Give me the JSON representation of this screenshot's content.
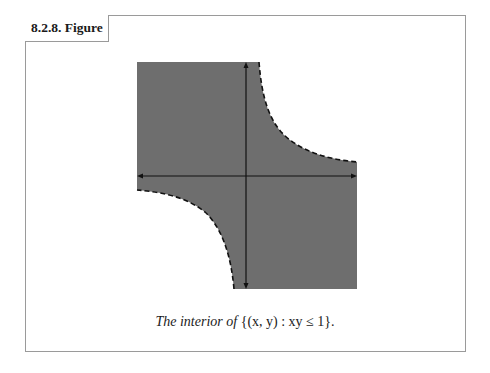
{
  "figure": {
    "section_title": "8.2.8. Figure",
    "caption": {
      "text_italic": "The interior of",
      "math": " {(x, y) : xy ≤ 1}."
    },
    "colors": {
      "region_fill": "#6e6e6e",
      "axis": "#111111",
      "boundary": "#111111",
      "frame": "#9a9a9a"
    },
    "plot": {
      "region": "interior of {(x, y) : xy ≤ 1}",
      "boundary_curve": "xy = 1 (dashed, excluded)",
      "axes": [
        "x-axis (double-headed arrow)",
        "y-axis (double-headed arrow)"
      ]
    }
  }
}
